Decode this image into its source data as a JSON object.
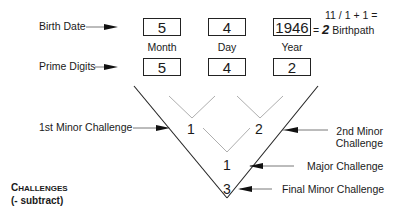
{
  "rows": {
    "birth_date": {
      "label": "Birth Date",
      "values": {
        "month": "5",
        "day": "4",
        "year": "1946"
      }
    },
    "column_labels": {
      "month": "Month",
      "day": "Day",
      "year": "Year"
    },
    "prime_digits": {
      "label": "Prime Digits",
      "values": {
        "month": "5",
        "day": "4",
        "year": "2"
      }
    }
  },
  "birthpath": {
    "equation": "11 / 1 + 1 =",
    "equals": "=",
    "value": "2",
    "label": "Birthpath"
  },
  "challenges": {
    "first_minor": {
      "value": "1",
      "label": "1st Minor Challenge"
    },
    "second_minor": {
      "value": "2",
      "label_line1": "2nd Minor",
      "label_line2": "Challenge"
    },
    "major": {
      "value": "1",
      "label": "Major Challenge"
    },
    "final_minor": {
      "value": "3",
      "label": "Final Minor Challenge"
    }
  },
  "legend": {
    "title_first": "C",
    "title_rest": "HALLENGES",
    "subtitle": "(- subtract)"
  },
  "colors": {
    "line_dark": "#222222",
    "line_light": "#9a9a9a",
    "text": "#1a1a1a"
  }
}
